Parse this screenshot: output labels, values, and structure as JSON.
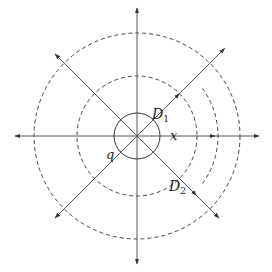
{
  "diagram": {
    "type": "field-lines-and-equipotentials",
    "center": [
      137,
      136
    ],
    "charge_circle": {
      "r": 23,
      "style": "solid"
    },
    "dashed_circles": [
      {
        "r": 60
      },
      {
        "r": 103
      }
    ],
    "partial_arc": {
      "r": 81,
      "from_deg": -36,
      "to_deg": 36
    },
    "colors": {
      "line": "#555555",
      "text": "#222222",
      "background": "#ffffff"
    },
    "labels": {
      "charge": "q",
      "d1_main": "D",
      "d1_sub": "1",
      "d2_main": "D",
      "d2_sub": "2",
      "x": "x"
    },
    "rays": [
      {
        "name": "ray-up",
        "angle_deg": 90,
        "length": 128,
        "mid_arrow": false
      },
      {
        "name": "ray-down",
        "angle_deg": -90,
        "length": 128,
        "mid_arrow": false
      },
      {
        "name": "ray-left",
        "angle_deg": 180,
        "length": 122,
        "mid_arrow": false
      },
      {
        "name": "ray-right",
        "angle_deg": 0,
        "length": 122,
        "mid_arrow": true,
        "mid_at": 78
      },
      {
        "name": "ray-up-left",
        "angle_deg": 135,
        "length": 116,
        "mid_arrow": false
      },
      {
        "name": "ray-up-right",
        "angle_deg": 45,
        "length": 124,
        "mid_arrow": true,
        "mid_at": 60
      },
      {
        "name": "ray-down-left",
        "angle_deg": -135,
        "length": 116,
        "mid_arrow": false
      },
      {
        "name": "ray-down-right",
        "angle_deg": -45,
        "length": 116,
        "mid_arrow": true,
        "mid_at": 84
      }
    ]
  }
}
